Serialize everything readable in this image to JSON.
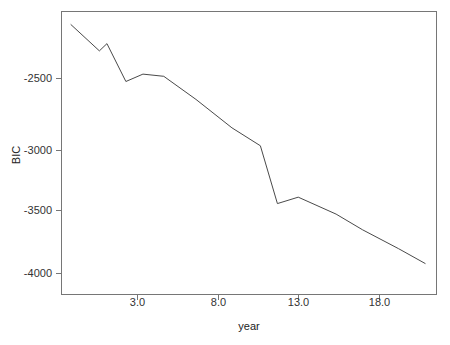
{
  "chart_data": {
    "type": "line",
    "title": "",
    "xlabel": "year",
    "ylabel": "BIC",
    "xlim": [
      0.6,
      20.4
    ],
    "ylim": [
      -4150,
      -2080
    ],
    "grid": false,
    "legend": null,
    "xticks": [
      "3.0",
      "8.0",
      "13.0",
      "18.0"
    ],
    "xtick_values": [
      3.0,
      8.0,
      13.0,
      18.0
    ],
    "yticks": [
      "-2500",
      "-3000",
      "-3500",
      "-4000"
    ],
    "ytick_values": [
      -2500,
      -3000,
      -3500,
      -4000
    ],
    "series": [
      {
        "name": "BIC",
        "color": "#4a4a4a",
        "x": [
          1.1,
          2.6,
          3.0,
          4.0,
          4.9,
          6.0,
          7.7,
          9.6,
          11.1,
          12.0,
          13.1,
          15.1,
          16.5,
          18.4,
          19.8
        ],
        "y": [
          -2176,
          -2368,
          -2315,
          -2592,
          -2538,
          -2554,
          -2723,
          -2931,
          -3062,
          -3485,
          -3438,
          -3562,
          -3677,
          -3815,
          -3923
        ]
      }
    ]
  },
  "axes": {
    "y_axis_label": "BIC",
    "x_axis_label": "year"
  }
}
